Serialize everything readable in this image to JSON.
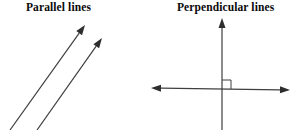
{
  "figures": {
    "parallel": {
      "title": "Parallel lines"
    },
    "perpendicular": {
      "title": "Perpendicular lines"
    }
  },
  "colors": {
    "line": "#3f3f3f",
    "arrowhead": "#2e2e2e",
    "title_text": "#0a0a0a",
    "background": "#ffffff"
  }
}
